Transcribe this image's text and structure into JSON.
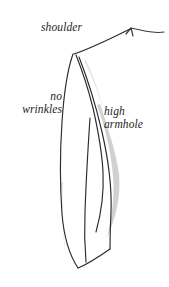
{
  "figure": {
    "type": "technical-fashion-sketch",
    "background_color": "#ffffff",
    "ink_color": "#2b2b2b",
    "shade_color": "#b9b9b9"
  },
  "annotations": {
    "shoulder": {
      "text": "shoulder",
      "lines": [
        "shoulder"
      ]
    },
    "no_wrinkles": {
      "text": "no wrinkles",
      "lines": [
        "no",
        "wrinkles"
      ]
    },
    "high_armhole": {
      "text": "high armhole",
      "lines": [
        "high",
        "armhole"
      ]
    }
  },
  "pointers": {
    "shoulder_arrow": {
      "label": "shoulder-pointer-arrow",
      "description": "curved arrow pointing up-left toward shoulder seam"
    }
  }
}
